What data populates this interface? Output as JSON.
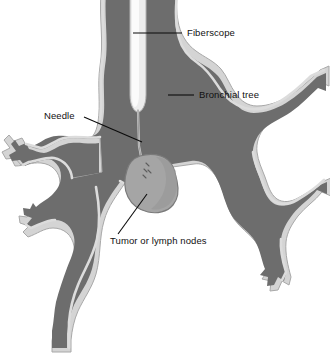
{
  "figure": {
    "background_color": "#ffffff"
  },
  "colors": {
    "airway_fill": "#6d6d6d",
    "airway_wall": "#d2d2d2",
    "airway_wall_shadow": "#9a9a9a",
    "fiberscope_fill": "#ededed",
    "fiberscope_edge": "#b8b8b8",
    "tumor_fill": "#a3a3a3",
    "tumor_edge": "#7c7c7c",
    "needle": "#c9c9c9",
    "leader_line": "#0b0b0b",
    "label_text": "#111111"
  },
  "labels": [
    {
      "id": "fiberscope",
      "text": "Fiberscope",
      "text_x": 187,
      "text_y": 36,
      "anchor": "start",
      "leader": "M133,33 L182,33"
    },
    {
      "id": "bronchial-tree",
      "text": "Bronchial tree",
      "text_x": 199,
      "text_y": 98,
      "anchor": "start",
      "leader": "M168,95 L194,95"
    },
    {
      "id": "needle",
      "text": "Needle",
      "text_x": 44,
      "text_y": 119,
      "anchor": "start",
      "leader": "M84,117 L142,142"
    },
    {
      "id": "tumor-or-lymph-nodes",
      "text": "Tumor or lymph nodes",
      "text_x": 110,
      "text_y": 244,
      "anchor": "start",
      "leader": "M147,194 L118,234"
    }
  ],
  "structures": {
    "trachea": "trachea-and-bronchial-tree",
    "fiberscope": "fiberscope-tube",
    "needle": "aspiration-needle",
    "tumor": "tumor-or-lymph-node-mass",
    "needle_marks": "needle-puncture-marks"
  }
}
